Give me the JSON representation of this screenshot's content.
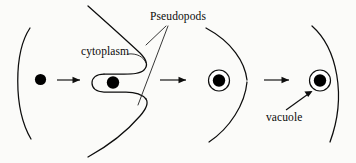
{
  "diagram": {
    "title_visible": false,
    "background_color": "#fbfbf9",
    "ink_color": "#0d0d0d",
    "labels": {
      "pseudopods": "Pseudopods",
      "cytoplasm": "cytoplasm",
      "vacuole": "vacuole"
    },
    "stages": [
      {
        "index": 1,
        "name": "particle-outside-cell",
        "elements": [
          "cell-membrane-arc",
          "food-particle"
        ]
      },
      {
        "index": 2,
        "name": "pseudopods-engulfing-particle",
        "elements": [
          "upper-pseudopod",
          "lower-pseudopod",
          "cytoplasm-pocket",
          "food-particle"
        ]
      },
      {
        "index": 3,
        "name": "vacuole-formed",
        "elements": [
          "cell-membrane-arc",
          "vacuole-ring",
          "food-particle"
        ]
      },
      {
        "index": 4,
        "name": "vacuole-inside-cytoplasm",
        "elements": [
          "cell-membrane-arc",
          "vacuole-ring",
          "food-particle"
        ]
      }
    ],
    "arrows": [
      {
        "name": "arrow-stage-1-to-2",
        "direction": "right"
      },
      {
        "name": "arrow-stage-2-to-3",
        "direction": "right"
      },
      {
        "name": "arrow-stage-3-to-4",
        "direction": "right"
      }
    ]
  }
}
